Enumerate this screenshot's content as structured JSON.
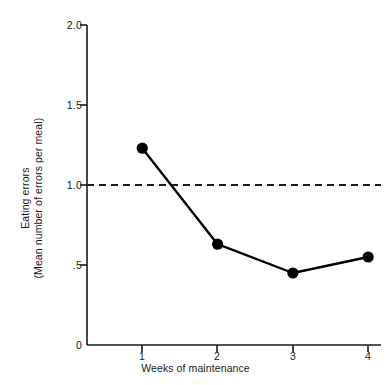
{
  "chart_data": {
    "type": "line",
    "title": "",
    "xlabel": "Weeks of maintenance",
    "ylabel": "Eating errors",
    "ylabel_sub": "(Mean number of errors per meal)",
    "x": [
      1,
      2,
      3,
      4
    ],
    "categories": [
      "1",
      "2",
      "3",
      "4"
    ],
    "values": [
      1.23,
      0.63,
      0.45,
      0.55
    ],
    "series": [
      {
        "name": "Eating errors",
        "values": [
          1.23,
          0.63,
          0.45,
          0.55
        ]
      }
    ],
    "xlim": [
      0.6,
      4.3
    ],
    "ylim": [
      0,
      2.0
    ],
    "xticks": [
      1,
      2,
      3,
      4
    ],
    "xtick_labels": [
      "1",
      "2",
      "3",
      "4"
    ],
    "yticks": [
      0,
      0.5,
      1.0,
      1.5,
      2.0
    ],
    "ytick_labels": [
      "0",
      ".5",
      "1.0",
      "1.5",
      "2.0"
    ],
    "grid": false,
    "legend": "none",
    "annotations": [
      {
        "type": "reference-line",
        "orientation": "horizontal",
        "value": 1.0,
        "style": "dashed",
        "label": ""
      }
    ],
    "marker": "filled-circle",
    "line_color": "#000000",
    "marker_color": "#000000"
  },
  "axes": {
    "y_tick_labels": [
      "2.0",
      "1.5",
      "1.0",
      ".5",
      "0"
    ],
    "x_tick_labels": [
      "1",
      "2",
      "3",
      "4"
    ]
  },
  "caption": {
    "text": ""
  }
}
